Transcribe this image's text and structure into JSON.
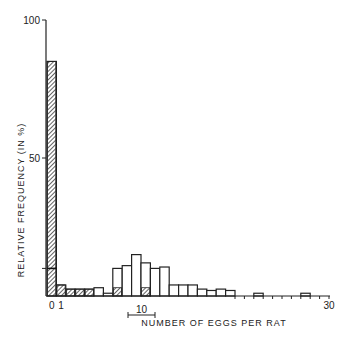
{
  "chart_data": {
    "type": "bar",
    "title": "",
    "xlabel": "NUMBER OF EGGS PER RAT",
    "ylabel": "RELATIVE FREQUENCY (IN %)",
    "ylim": [
      0,
      100
    ],
    "xlim": [
      0,
      30
    ],
    "y_ticks": [
      {
        "value": 50,
        "label": "50"
      },
      {
        "value": 100,
        "label": "100"
      }
    ],
    "x_tick_labels": [
      {
        "value": 0,
        "label": "0"
      },
      {
        "value": 1,
        "label": "1"
      },
      {
        "value": 30,
        "label": "30"
      }
    ],
    "scale_bar": {
      "label": "10",
      "from": 8.5,
      "to": 11.5
    },
    "grid": false,
    "legend": null,
    "categories": [
      0,
      1,
      2,
      3,
      4,
      5,
      6,
      7,
      8,
      9,
      10,
      11,
      12,
      13,
      14,
      15,
      16,
      17,
      18,
      19,
      20,
      21,
      22,
      23,
      24,
      25,
      26,
      27,
      28,
      29
    ],
    "series": [
      {
        "name": "hatched",
        "pattern": "hatched",
        "values": [
          85,
          4,
          2.5,
          2.5,
          2.5,
          0,
          0,
          3,
          0,
          0,
          3,
          0,
          0,
          0,
          0,
          0,
          0,
          0,
          0,
          0,
          0,
          0,
          0,
          0,
          0,
          0,
          0,
          0,
          0,
          0
        ]
      },
      {
        "name": "open",
        "pattern": "open",
        "values": [
          10,
          4,
          2.5,
          2.5,
          2.5,
          3,
          1,
          10,
          11,
          15,
          12,
          10,
          10.5,
          4,
          4,
          4,
          2.5,
          2,
          2.5,
          2,
          0,
          0,
          1,
          0,
          0,
          0,
          0,
          1,
          0,
          0
        ]
      }
    ]
  }
}
